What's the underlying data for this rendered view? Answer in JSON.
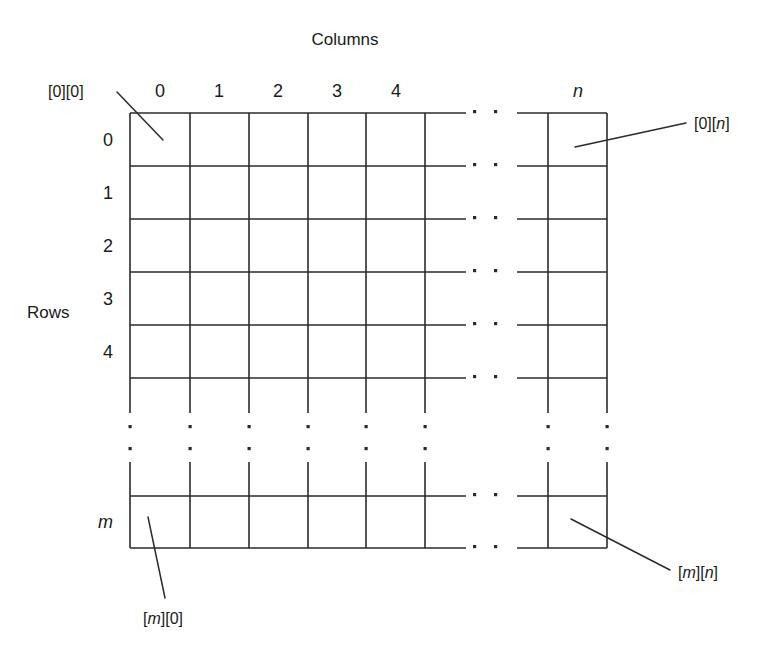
{
  "figure": {
    "title_columns": "Columns",
    "title_rows": "Rows",
    "column_headers": [
      "0",
      "1",
      "2",
      "3",
      "4"
    ],
    "column_header_last": "n",
    "row_headers": [
      "0",
      "1",
      "2",
      "3",
      "4"
    ],
    "row_header_last": "m",
    "callouts": {
      "top_left": "[0][0]",
      "top_right": "[0][n]",
      "bottom_left": "[m][0]",
      "bottom_right": "[m][n]"
    },
    "ellipsis_glyph": "·",
    "colors": {
      "line": "#2b2b2b",
      "text": "#1a1a1a",
      "background": "#ffffff"
    }
  },
  "chart_data": {
    "type": "table",
    "xlabel": "Columns",
    "ylabel": "Rows",
    "columns": [
      "0",
      "1",
      "2",
      "3",
      "4",
      "...",
      "n"
    ],
    "rows": [
      "0",
      "1",
      "2",
      "3",
      "4",
      "...",
      "m"
    ],
    "cell_annotations": [
      {
        "cell": "[0][0]",
        "position": "top-left"
      },
      {
        "cell": "[0][n]",
        "position": "top-right"
      },
      {
        "cell": "[m][0]",
        "position": "bottom-left"
      },
      {
        "cell": "[m][n]",
        "position": "bottom-right"
      }
    ],
    "grid": true,
    "legend": "none"
  }
}
